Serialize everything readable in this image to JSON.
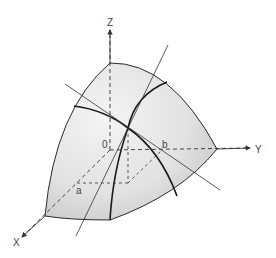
{
  "diagram": {
    "type": "3d-surface-octant",
    "labels": {
      "z_axis": "Z",
      "y_axis": "Y",
      "x_axis": "X",
      "origin": "0",
      "point_a": "a",
      "point_b": "b"
    },
    "colors": {
      "surface_fill": "#e6e6e6",
      "surface_edge": "#2a2a2a",
      "axis": "#333333",
      "background": "#ffffff"
    }
  }
}
